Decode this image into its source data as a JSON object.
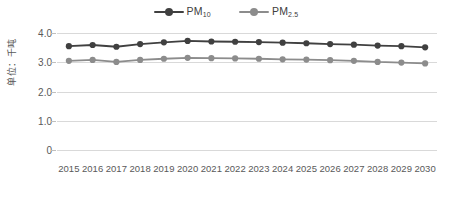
{
  "legend": {
    "position": "top-center",
    "items": [
      {
        "name": "pm10",
        "label": "PM",
        "sub": "10",
        "color": "#404040"
      },
      {
        "name": "pm25",
        "label": "PM",
        "sub": "2.5",
        "color": "#8c8c8c"
      }
    ]
  },
  "axes": {
    "ylabel": "单位：千吨",
    "yticks": [
      "4.0",
      "3.0",
      "2.0",
      "1.0",
      "0"
    ],
    "ylim": [
      0,
      4.0
    ],
    "grid": true
  },
  "chart_data": {
    "type": "line",
    "title": "",
    "xlabel": "",
    "ylabel": "单位：千吨",
    "ylim": [
      0,
      4.0
    ],
    "yticks": [
      4.0,
      3.0,
      2.0,
      1.0,
      0
    ],
    "grid": true,
    "legend_position": "top-center",
    "categories": [
      "2015",
      "2016",
      "2017",
      "2018",
      "2019",
      "2020",
      "2021",
      "2022",
      "2023",
      "2024",
      "2025",
      "2026",
      "2027",
      "2028",
      "2029",
      "2030"
    ],
    "series": [
      {
        "name": "PM10",
        "color": "#404040",
        "values": [
          3.55,
          3.59,
          3.53,
          3.62,
          3.68,
          3.73,
          3.71,
          3.7,
          3.69,
          3.67,
          3.65,
          3.62,
          3.6,
          3.57,
          3.55,
          3.51
        ]
      },
      {
        "name": "PM2.5",
        "color": "#8c8c8c",
        "values": [
          3.05,
          3.08,
          3.01,
          3.08,
          3.12,
          3.15,
          3.14,
          3.13,
          3.12,
          3.1,
          3.09,
          3.07,
          3.05,
          3.01,
          2.99,
          2.96
        ]
      }
    ]
  }
}
